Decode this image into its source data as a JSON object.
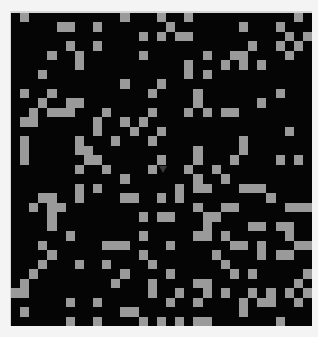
{
  "board": {
    "cols": 33,
    "rows": 33,
    "colors": {
      "background": "#050505",
      "alive": "#9a9a9a",
      "page": "#f4f4f4"
    },
    "alive_cells_by_row": [
      [
        1,
        12,
        16,
        19,
        31
      ],
      [
        5,
        6,
        9,
        17,
        25,
        29
      ],
      [
        14,
        16,
        18,
        19,
        30,
        32
      ],
      [
        6,
        9,
        26,
        29,
        31
      ],
      [
        4,
        7,
        14,
        21,
        24,
        25,
        30
      ],
      [
        7,
        19,
        23,
        25,
        27
      ],
      [
        3,
        19,
        21
      ],
      [
        12,
        16
      ],
      [
        1,
        4,
        15,
        20,
        29
      ],
      [
        3,
        6,
        7,
        20,
        27
      ],
      [
        2,
        4,
        5,
        6,
        10,
        15,
        19,
        21,
        23,
        24
      ],
      [
        1,
        2,
        9,
        12,
        14
      ],
      [
        9,
        13,
        16,
        30
      ],
      [
        1,
        7,
        11,
        15,
        25
      ],
      [
        1,
        7,
        8,
        20,
        25
      ],
      [
        1,
        8,
        9,
        16,
        20,
        24,
        29,
        31
      ],
      [
        7,
        10,
        15,
        19,
        22
      ],
      [
        12,
        20,
        23
      ],
      [
        7,
        9,
        18,
        20,
        21,
        25,
        26,
        27
      ],
      [
        3,
        4,
        7,
        12,
        13,
        16,
        18,
        28
      ],
      [
        2,
        4,
        5,
        20,
        23,
        24,
        30,
        31,
        32
      ],
      [
        4,
        14,
        16,
        17,
        21,
        22
      ],
      [
        4,
        21,
        26,
        27,
        29,
        30
      ],
      [
        6,
        14,
        20,
        21,
        23,
        30
      ],
      [
        3,
        10,
        11,
        12,
        17,
        24,
        25,
        27,
        31,
        32
      ],
      [
        4,
        14,
        22,
        27,
        29,
        30
      ],
      [
        3,
        7,
        10,
        15,
        23
      ],
      [
        2,
        12,
        17,
        24,
        26,
        32
      ],
      [
        1,
        11,
        15,
        20,
        21,
        31
      ],
      [
        0,
        1,
        15,
        18,
        21,
        23,
        26,
        28,
        30,
        32
      ],
      [
        6,
        9,
        17,
        20,
        25,
        27,
        28,
        31
      ],
      [
        1,
        12,
        13,
        25
      ],
      [
        6,
        9,
        14,
        16,
        18,
        20,
        21,
        29
      ]
    ]
  },
  "cursor": {
    "icon": "mouse-pointer-icon"
  }
}
